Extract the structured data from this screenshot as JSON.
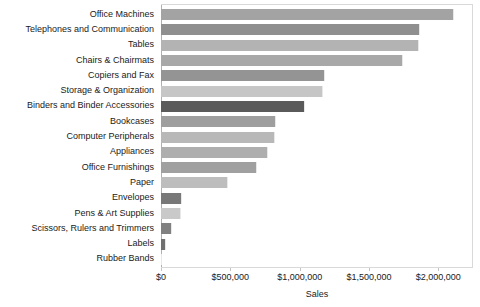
{
  "chart_data": {
    "type": "bar",
    "orientation": "horizontal",
    "title": "",
    "xlabel": "Sales",
    "ylabel": "",
    "xlim": [
      0,
      2250000
    ],
    "grid": false,
    "legend": false,
    "x_tick_labels": [
      "$0",
      "$500,000",
      "$1,000,000",
      "$1,500,000",
      "$2,000,000"
    ],
    "x_tick_values": [
      0,
      500000,
      1000000,
      1500000,
      2000000
    ],
    "categories": [
      "Office Machines",
      "Telephones and Communication",
      "Tables",
      "Chairs & Chairmats",
      "Copiers and Fax",
      "Storage & Organization",
      "Binders and Binder Accessories",
      "Bookcases",
      "Computer Peripherals",
      "Appliances",
      "Office Furnishings",
      "Paper",
      "Envelopes",
      "Pens & Art Supplies",
      "Scissors, Rulers and Trimmers",
      "Labels",
      "Rubber Bands"
    ],
    "values": [
      2110000,
      1865000,
      1860000,
      1745000,
      1180000,
      1165000,
      1035000,
      830000,
      820000,
      775000,
      695000,
      485000,
      150000,
      145000,
      80000,
      35000,
      10000
    ],
    "bar_colors": [
      "#a3a3a3",
      "#8f8f8f",
      "#b3b3b3",
      "#a8a8a8",
      "#949494",
      "#c6c6c6",
      "#5a5a5a",
      "#9e9e9e",
      "#b8b8b8",
      "#aeaeae",
      "#a0a0a0",
      "#bdbdbd",
      "#787878",
      "#c9c9c9",
      "#808080",
      "#707070",
      "#cfcfcf"
    ]
  }
}
